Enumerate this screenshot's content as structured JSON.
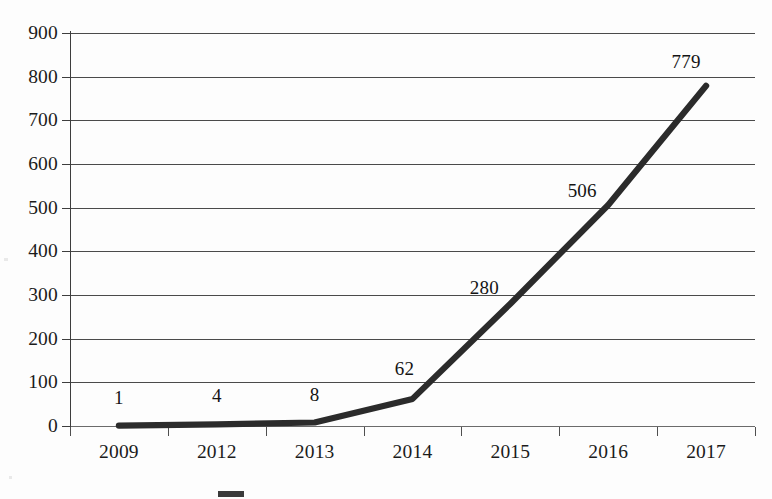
{
  "chart_data": {
    "type": "line",
    "title": "",
    "subtitle": "",
    "xlabel": "",
    "ylabel": "",
    "categories": [
      "2009",
      "2012",
      "2013",
      "2014",
      "2015",
      "2016",
      "2017"
    ],
    "values": [
      1,
      4,
      8,
      62,
      280,
      506,
      779
    ],
    "point_labels": [
      "1",
      "4",
      "8",
      "62",
      "280",
      "506",
      "779"
    ],
    "series": [
      {
        "name": "",
        "values": [
          1,
          4,
          8,
          62,
          280,
          506,
          779
        ],
        "color": "#2b2b2b"
      }
    ],
    "ylim": [
      0,
      900
    ],
    "ytick_labels": [
      "0",
      "100",
      "200",
      "300",
      "400",
      "500",
      "600",
      "700",
      "800",
      "900"
    ],
    "ytick_values": [
      0,
      100,
      200,
      300,
      400,
      500,
      600,
      700,
      800,
      900
    ],
    "grid": true,
    "grid_axis": "y",
    "legend_position": "bottom",
    "legend_entries": [
      {
        "label": "",
        "marker": "line-swatch",
        "color": "#3a3a3a"
      }
    ]
  },
  "axes": {
    "y_labels": [
      "900",
      "800",
      "700",
      "600",
      "500",
      "400",
      "300",
      "200",
      "100",
      "0"
    ],
    "x_labels": [
      "2009",
      "2012",
      "2013",
      "2014",
      "2015",
      "2016",
      "2017"
    ]
  },
  "annotations": {
    "point_labels": [
      "1",
      "4",
      "8",
      "62",
      "280",
      "506",
      "779"
    ]
  },
  "legend": {
    "swatch_name": "series-line-swatch",
    "caption": ""
  },
  "colors": {
    "series_line": "#2b2b2b",
    "gridline": "#4a4a4a",
    "axis": "#3d3d3d",
    "text": "#1b1b1b",
    "background": "#fdfdfd"
  }
}
